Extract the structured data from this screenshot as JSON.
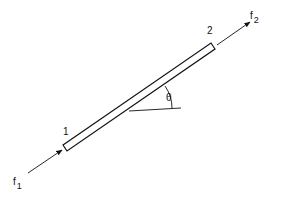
{
  "diagram": {
    "type": "truss bar element",
    "nodes": [
      {
        "id": "node-1",
        "label": "1"
      },
      {
        "id": "node-2",
        "label": "2"
      }
    ],
    "forces": [
      {
        "name": "f",
        "subscript": "1"
      },
      {
        "name": "f",
        "subscript": "2"
      }
    ],
    "angle_label": "θ",
    "colors": {
      "stroke": "#111111",
      "background": "#ffffff"
    }
  }
}
